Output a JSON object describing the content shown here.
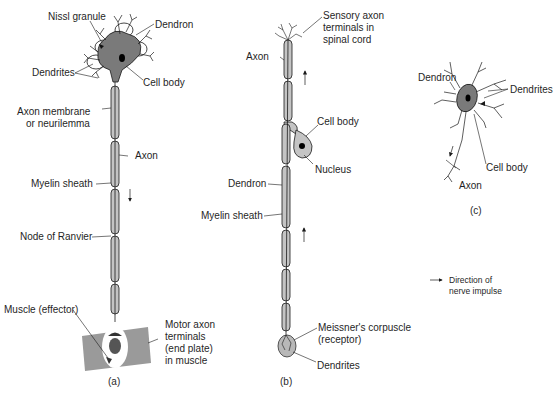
{
  "figure": {
    "panels": [
      {
        "id": "a",
        "caption": "(a)",
        "type": "motor neuron",
        "labels": {
          "nissl_granule": "Nissl granule",
          "dendron": "Dendron",
          "dendrites": "Dendrites",
          "cell_body": "Cell body",
          "axon_membrane_line1": "Axon membrane",
          "axon_membrane_line2": "or neurilemma",
          "axon": "Axon",
          "myelin_sheath": "Myelin sheath",
          "node_of_ranvier": "Node of Ranvier",
          "muscle": "Muscle (effector)",
          "motor_terminals_line1": "Motor axon",
          "motor_terminals_line2": "terminals",
          "motor_terminals_line3": "(end plate)",
          "motor_terminals_line4": "in muscle"
        },
        "impulse_direction": "down"
      },
      {
        "id": "b",
        "caption": "(b)",
        "type": "sensory neuron",
        "labels": {
          "sensory_terminals_line1": "Sensory axon",
          "sensory_terminals_line2": "terminals in",
          "sensory_terminals_line3": "spinal cord",
          "axon": "Axon",
          "cell_body": "Cell body",
          "nucleus": "Nucleus",
          "dendron": "Dendron",
          "myelin_sheath": "Myelin sheath",
          "meissner_line1": "Meissner's corpuscle",
          "meissner_line2": "(receptor)",
          "dendrites": "Dendrites"
        },
        "impulse_direction": "up"
      },
      {
        "id": "c",
        "caption": "(c)",
        "type": "relay neuron",
        "labels": {
          "dendron": "Dendron",
          "dendrites": "Dendrites",
          "cell_body": "Cell body",
          "axon": "Axon"
        }
      }
    ],
    "legend": {
      "icon": "arrow-right-icon",
      "line1": "Direction of",
      "line2": "nerve impulse"
    },
    "colors": {
      "cell_body_fill": "#7a7a7a",
      "myelin_fill": "#c4c4c4",
      "muscle_fill": "#9a9a9a",
      "stroke": "#1a1a1a",
      "nucleus": "#000000"
    }
  }
}
